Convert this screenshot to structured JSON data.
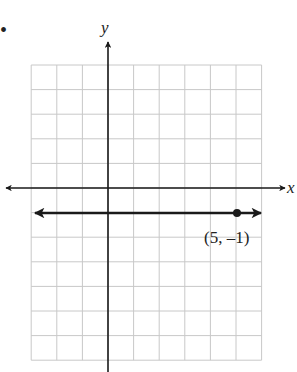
{
  "chart_data": {
    "type": "line",
    "title": "",
    "xlabel": "x",
    "ylabel": "y",
    "xlim": [
      -3,
      6
    ],
    "ylim": [
      -7,
      5
    ],
    "grid": true,
    "series": [
      {
        "name": "y = -1",
        "kind": "horizontal line with arrows both ends",
        "y": -1,
        "x_range": [
          -3,
          6
        ]
      }
    ],
    "points": [
      {
        "x": 5,
        "y": -1,
        "label": "(5, –1)"
      }
    ]
  },
  "labels": {
    "x_axis": "x",
    "y_axis": "y",
    "point": "(5, –1)",
    "bullet": "•"
  },
  "colors": {
    "grid": "#c8c8c8",
    "axis": "#1a1a1a",
    "line": "#1a1a1a"
  }
}
